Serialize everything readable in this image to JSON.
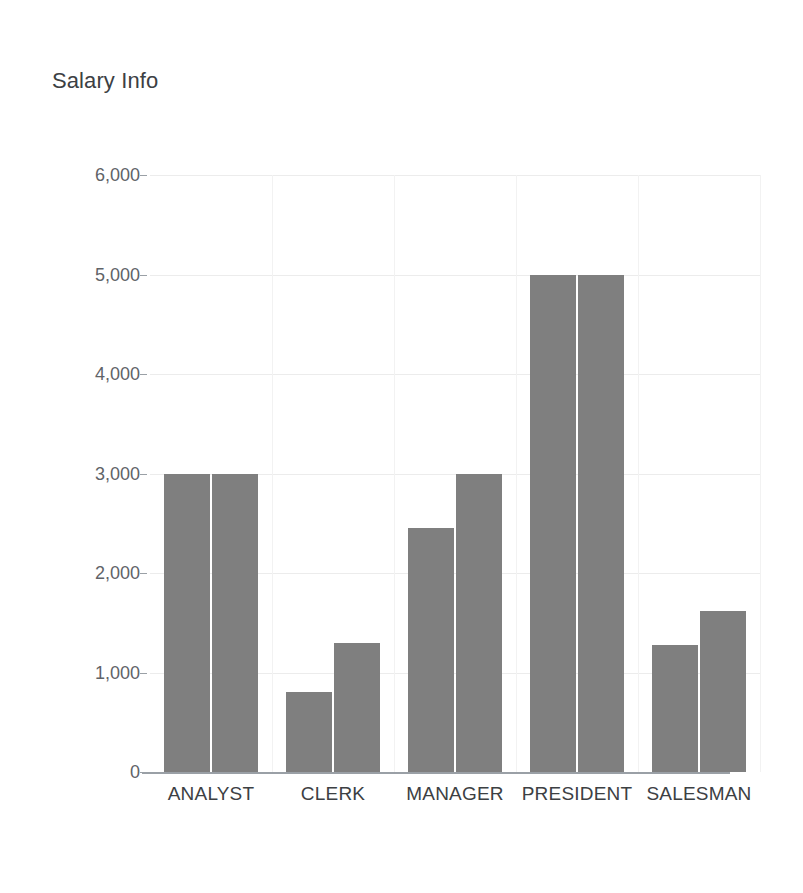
{
  "chart_data": {
    "type": "bar",
    "title": "Salary Info",
    "xlabel": "",
    "ylabel": "",
    "categories": [
      "ANALYST",
      "CLERK",
      "MANAGER",
      "PRESIDENT",
      "SALESMAN"
    ],
    "series": [
      {
        "name": "series-1",
        "values": [
          3000,
          800,
          2450,
          5000,
          1280
        ]
      },
      {
        "name": "series-2",
        "values": [
          3000,
          1300,
          3000,
          5000,
          1620
        ]
      }
    ],
    "ylim": [
      0,
      6000
    ],
    "ytick_values": [
      0,
      1000,
      2000,
      3000,
      4000,
      5000,
      6000
    ],
    "ytick_labels": [
      "0",
      "1,000",
      "2,000",
      "3,000",
      "4,000",
      "5,000",
      "6,000"
    ],
    "grid": true,
    "grid_axis": "both",
    "legend": false,
    "legend_position": "none",
    "bar_color": "#7f7f7f",
    "grid_color": "#ececec",
    "axis_color": "#9aa0a6",
    "text_color": "#3c4043",
    "background": "#ffffff"
  }
}
